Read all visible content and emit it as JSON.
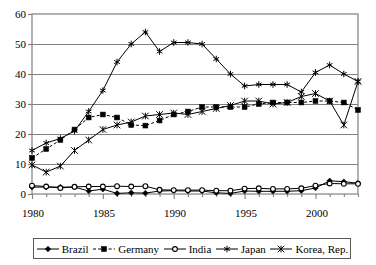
{
  "chart_data": {
    "type": "line",
    "title": "",
    "xlabel": "",
    "ylabel": "",
    "xlim": [
      1980,
      2003
    ],
    "ylim": [
      0,
      60
    ],
    "yticks": [
      0,
      10,
      20,
      30,
      40,
      50,
      60
    ],
    "xticks": [
      1980,
      1985,
      1990,
      1995,
      2000
    ],
    "xtick_labels": [
      "1980",
      "1985",
      "1990",
      "1995",
      "2000"
    ],
    "ytick_labels": [
      "0",
      "10",
      "20",
      "30",
      "40",
      "50",
      "60"
    ],
    "grid": "horizontal",
    "legend_position": "bottom",
    "x": [
      1980,
      1981,
      1982,
      1983,
      1984,
      1985,
      1986,
      1987,
      1988,
      1989,
      1990,
      1991,
      1992,
      1993,
      1994,
      1995,
      1996,
      1997,
      1998,
      1999,
      2000,
      2001,
      2002,
      2003
    ],
    "series": [
      {
        "name": "Brazil",
        "marker": "diamond",
        "dash": "solid",
        "values": [
          2.3,
          2.3,
          2.3,
          2.3,
          1.0,
          1.6,
          0.2,
          0.4,
          0.3,
          1.0,
          1.1,
          1.0,
          1.0,
          0.4,
          0.2,
          1.0,
          0.9,
          0.9,
          0.9,
          1.1,
          2.0,
          4.4,
          4.1,
          3.6
        ]
      },
      {
        "name": "Germany",
        "marker": "square",
        "dash": "dashed",
        "values": [
          12.0,
          15.0,
          18.0,
          21.5,
          25.5,
          26.5,
          25.5,
          23.0,
          22.8,
          24.5,
          26.5,
          27.5,
          29.0,
          29.0,
          29.0,
          29.0,
          30.0,
          30.5,
          30.5,
          30.5,
          31.0,
          31.0,
          30.5,
          28.0
        ]
      },
      {
        "name": "India",
        "marker": "circle",
        "dash": "solid",
        "values": [
          2.8,
          2.5,
          2.0,
          2.4,
          2.5,
          2.5,
          2.6,
          2.5,
          2.6,
          1.4,
          1.3,
          1.3,
          1.3,
          1.1,
          1.1,
          1.8,
          1.9,
          1.7,
          1.7,
          1.9,
          2.8,
          3.5,
          3.4,
          3.4
        ]
      },
      {
        "name": "Japan",
        "marker": "star",
        "dash": "solid",
        "values": [
          14.5,
          17.0,
          18.5,
          21.0,
          27.5,
          34.5,
          44.0,
          50.0,
          54.0,
          47.5,
          50.5,
          50.5,
          50.0,
          45.0,
          40.0,
          36.0,
          36.5,
          36.5,
          36.5,
          34.0,
          40.5,
          43.0,
          40.0,
          37.5
        ]
      },
      {
        "name": "Korea, Rep.",
        "marker": "cross",
        "dash": "solid",
        "values": [
          9.7,
          7.3,
          9.3,
          14.5,
          18.0,
          21.5,
          23.0,
          24.0,
          26.0,
          26.5,
          27.0,
          26.5,
          27.5,
          28.5,
          29.5,
          31.0,
          31.0,
          30.0,
          30.5,
          32.5,
          33.5,
          31.0,
          23.0,
          37.5
        ]
      }
    ],
    "series_plotted": [
      {
        "name": "Brazil",
        "points": [
          [
            1980,
            2.3
          ],
          [
            1981,
            2.3
          ],
          [
            1982,
            2.3
          ],
          [
            1983,
            2.3
          ],
          [
            1984,
            1.0
          ],
          [
            1985,
            1.6
          ],
          [
            1986,
            0.2
          ],
          [
            1987,
            0.4
          ],
          [
            1988,
            0.3
          ],
          [
            1989,
            1.0
          ],
          [
            1990,
            1.1
          ],
          [
            1991,
            1.0
          ],
          [
            1992,
            1.0
          ],
          [
            1993,
            0.4
          ],
          [
            1994,
            0.2
          ],
          [
            1995,
            1.0
          ],
          [
            1996,
            0.9
          ],
          [
            1997,
            0.9
          ],
          [
            1998,
            0.9
          ],
          [
            1999,
            1.1
          ],
          [
            2000,
            2.0
          ],
          [
            2001,
            4.4
          ],
          [
            2002,
            4.1
          ],
          [
            2003,
            3.6
          ]
        ]
      },
      {
        "name": "Germany",
        "points": [
          [
            1980,
            12.0
          ],
          [
            1981,
            15.0
          ],
          [
            1982,
            18.0
          ],
          [
            1983,
            21.5
          ],
          [
            1984,
            25.5
          ],
          [
            1985,
            26.5
          ],
          [
            1986,
            25.5
          ],
          [
            1987,
            23.0
          ],
          [
            1988,
            22.8
          ],
          [
            1989,
            24.5
          ],
          [
            1990,
            26.5
          ],
          [
            1991,
            27.5
          ],
          [
            1992,
            29.0
          ],
          [
            1993,
            29.0
          ],
          [
            1994,
            29.0
          ],
          [
            1995,
            29.0
          ],
          [
            1996,
            30.0
          ],
          [
            1997,
            30.5
          ],
          [
            1998,
            30.5
          ],
          [
            1999,
            30.5
          ],
          [
            2000,
            31.0
          ],
          [
            2001,
            31.0
          ],
          [
            2002,
            30.5
          ],
          [
            2003,
            28.0
          ]
        ]
      },
      {
        "name": "India",
        "points": [
          [
            1980,
            2.8
          ],
          [
            1981,
            2.5
          ],
          [
            1982,
            2.0
          ],
          [
            1983,
            2.4
          ],
          [
            1984,
            2.5
          ],
          [
            1985,
            2.5
          ],
          [
            1986,
            2.6
          ],
          [
            1987,
            2.5
          ],
          [
            1988,
            2.6
          ],
          [
            1989,
            1.4
          ],
          [
            1990,
            1.3
          ],
          [
            1991,
            1.3
          ],
          [
            1992,
            1.3
          ],
          [
            1993,
            1.1
          ],
          [
            1994,
            1.1
          ],
          [
            1995,
            1.8
          ],
          [
            1996,
            1.9
          ],
          [
            1997,
            1.7
          ],
          [
            1998,
            1.7
          ],
          [
            1999,
            1.9
          ],
          [
            2000,
            2.8
          ],
          [
            2001,
            3.5
          ],
          [
            2002,
            3.4
          ],
          [
            2003,
            3.4
          ]
        ]
      },
      {
        "name": "Japan",
        "points": [
          [
            1980,
            14.5
          ],
          [
            1981,
            17.0
          ],
          [
            1982,
            18.5
          ],
          [
            1983,
            21.0
          ],
          [
            1984,
            27.5
          ],
          [
            1985,
            34.5
          ],
          [
            1986,
            44.0
          ],
          [
            1987,
            50.0
          ],
          [
            1988,
            54.0
          ],
          [
            1989,
            47.5
          ],
          [
            1990,
            50.5
          ],
          [
            1991,
            50.5
          ],
          [
            1992,
            50.0
          ],
          [
            1993,
            45.0
          ],
          [
            1994,
            40.0
          ],
          [
            1995,
            36.0
          ],
          [
            1996,
            36.5
          ],
          [
            1997,
            36.5
          ],
          [
            1998,
            36.5
          ],
          [
            1999,
            34.0
          ],
          [
            2000,
            40.5
          ],
          [
            2001,
            43.0
          ],
          [
            2002,
            40.0
          ],
          [
            2003,
            37.5
          ]
        ]
      },
      {
        "name": "Korea, Rep.",
        "points": [
          [
            1980,
            9.7
          ],
          [
            1981,
            7.3
          ],
          [
            1982,
            9.3
          ],
          [
            1983,
            14.5
          ],
          [
            1984,
            18.0
          ],
          [
            1985,
            21.5
          ],
          [
            1986,
            23.0
          ],
          [
            1987,
            24.0
          ],
          [
            1988,
            26.0
          ],
          [
            1989,
            26.5
          ],
          [
            1990,
            27.0
          ],
          [
            1991,
            26.5
          ],
          [
            1992,
            27.5
          ],
          [
            1993,
            28.5
          ],
          [
            1994,
            29.5
          ],
          [
            1995,
            31.0
          ],
          [
            1996,
            31.0
          ],
          [
            1997,
            30.0
          ],
          [
            1998,
            30.5
          ],
          [
            1999,
            32.5
          ],
          [
            2000,
            33.5
          ],
          [
            2001,
            31.0
          ],
          [
            2002,
            23.0
          ],
          [
            2003,
            37.5
          ]
        ]
      }
    ]
  },
  "legend": {
    "items": [
      {
        "label": "Brazil",
        "marker": "diamond",
        "dash": "solid"
      },
      {
        "label": "Germany",
        "marker": "square",
        "dash": "dashed"
      },
      {
        "label": "India",
        "marker": "circle",
        "dash": "solid"
      },
      {
        "label": "Japan",
        "marker": "star",
        "dash": "solid"
      },
      {
        "label": "Korea, Rep.",
        "marker": "cross",
        "dash": "solid"
      }
    ]
  },
  "colors": {
    "line": "#000000",
    "grid": "#808080",
    "frame": "#808080",
    "background": "#ffffff",
    "text": "#000000"
  }
}
